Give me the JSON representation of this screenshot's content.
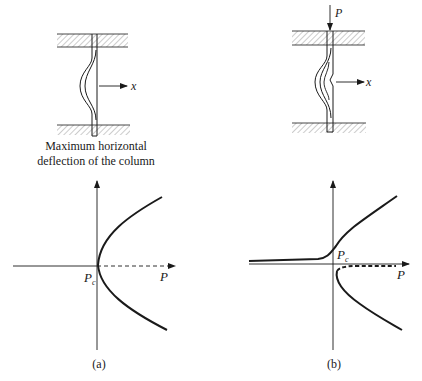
{
  "figure": {
    "panels": [
      {
        "id": "a",
        "caption": "(a)",
        "column": {
          "load_label": "",
          "deflection_label": "x",
          "description_lines": [
            "Maximum horizontal",
            "deflection of the column"
          ],
          "imperfect": false
        },
        "graph": {
          "x_axis_label": "P",
          "critical_label_main": "P",
          "critical_label_sub": "c",
          "branches": [
            {
              "name": "upper-stable-branch",
              "style": "solid"
            },
            {
              "name": "lower-stable-branch",
              "style": "solid"
            },
            {
              "name": "unstable-trivial-branch",
              "style": "dashed"
            }
          ]
        }
      },
      {
        "id": "b",
        "caption": "(b)",
        "column": {
          "load_label": "P",
          "deflection_label": "x",
          "imperfect": true
        },
        "graph": {
          "x_axis_label": "P",
          "critical_label_main": "P",
          "critical_label_sub": "c",
          "branches": [
            {
              "name": "imperfect-primary-branch",
              "style": "solid"
            },
            {
              "name": "lower-stable-branch",
              "style": "solid"
            },
            {
              "name": "unstable-branch",
              "style": "dashed"
            }
          ]
        }
      }
    ],
    "colors": {
      "ink": "#1a1a1a",
      "hatch": "#8a8a8a",
      "background": "#ffffff"
    }
  }
}
